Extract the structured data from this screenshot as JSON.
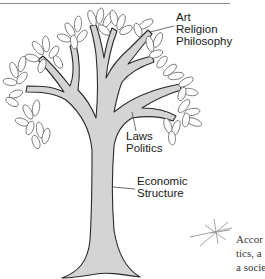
{
  "figure": {
    "labels": {
      "superstructure_culture": [
        "Art",
        "Religion",
        "Philosophy"
      ],
      "superstructure_politics": [
        "Laws",
        "Politics"
      ],
      "base": [
        "Economic",
        "Structure"
      ]
    },
    "colors": {
      "trunk_fill": "#d4d4d4",
      "outline": "#2a2a2a",
      "leaf_outline": "#6a6a6a",
      "rule": "#8a8a8a",
      "margin_mark": "#9a9a9a"
    }
  },
  "body_text": {
    "lines": [
      "Accor",
      "tics, a",
      "a socie",
      "       "
    ]
  }
}
